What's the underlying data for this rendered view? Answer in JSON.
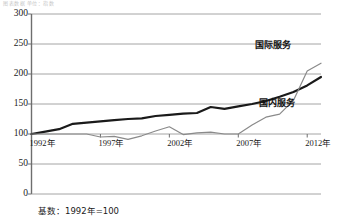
{
  "top_cut_text": "图表数据  单位：指数",
  "footnote": "基数：1992年=100",
  "colors": {
    "domestic_line": "#1a1a1a",
    "international_line": "#8a8a8a",
    "gridline": "#9a9a9a",
    "axis": "#6e6e6e",
    "text": "#1a1a1a"
  },
  "chart_data": {
    "type": "line",
    "title": "",
    "subtitle": "",
    "xlabel": "",
    "ylabel": "",
    "xlim": [
      1992,
      2013
    ],
    "ylim": [
      0,
      300
    ],
    "ytick_step": 50,
    "grid": true,
    "legend_position": "inline-right",
    "note": "基数：1992年=100",
    "yticks": [
      "0",
      "50",
      "100",
      "150",
      "200",
      "250",
      "300"
    ],
    "ytick_values": [
      0,
      50,
      100,
      150,
      200,
      250,
      300
    ],
    "xticks": [
      "1992年",
      "1997年",
      "2002年",
      "2007年",
      "2012年"
    ],
    "xtick_values": [
      1992,
      1997,
      2002,
      2007,
      2012
    ],
    "x": [
      1992,
      1993,
      1994,
      1995,
      1996,
      1997,
      1998,
      1999,
      2000,
      2001,
      2002,
      2003,
      2004,
      2005,
      2006,
      2007,
      2008,
      2009,
      2010,
      2011,
      2012,
      2013
    ],
    "series": [
      {
        "name": "国内服务",
        "color": "#1a1a1a",
        "width": 2.2,
        "label_text": "国内服务",
        "values": [
          100,
          104,
          108,
          117,
          119,
          121,
          123,
          125,
          126,
          130,
          132,
          134,
          135,
          145,
          142,
          146,
          150,
          155,
          162,
          170,
          181,
          195
        ]
      },
      {
        "name": "国际服务",
        "color": "#8a8a8a",
        "width": 1.2,
        "label_text": "国际服务",
        "values": [
          100,
          100,
          100,
          100,
          100,
          95,
          96,
          91,
          97,
          105,
          112,
          99,
          102,
          103,
          100,
          100,
          115,
          128,
          133,
          156,
          205,
          218
        ]
      }
    ]
  }
}
